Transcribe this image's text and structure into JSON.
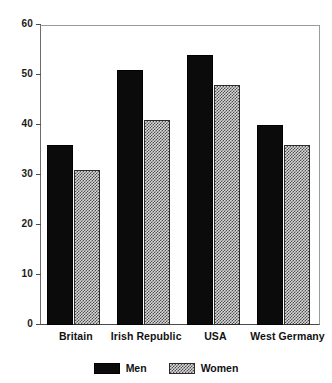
{
  "chart_data": {
    "type": "bar",
    "title": "",
    "subtitle": "",
    "xlabel": "",
    "ylabel": "",
    "categories": [
      "Britain",
      "Irish Republic",
      "USA",
      "West Germany"
    ],
    "series": [
      {
        "name": "Men",
        "values": [
          36,
          51,
          54,
          40
        ],
        "color": "#0b0b0b",
        "fill": "solid-black"
      },
      {
        "name": "Women",
        "values": [
          31,
          41,
          48,
          36
        ],
        "color": "#d8d8d8",
        "fill": "checkered-hatch"
      }
    ],
    "ylim": [
      0,
      60
    ],
    "ytick_step": 10,
    "yticks": [
      0,
      10,
      20,
      30,
      40,
      50,
      60
    ],
    "ytick_labels": [
      "0",
      "10",
      "20",
      "30",
      "40",
      "50",
      "60"
    ],
    "grid": false,
    "legend_position": "bottom-center",
    "frame": true
  },
  "legend": {
    "entries": [
      {
        "label": "Men",
        "swatch": "solid-black-swatch"
      },
      {
        "label": "Women",
        "swatch": "hatched-swatch"
      }
    ]
  },
  "colors": {
    "men_bar": "#0b0b0b",
    "women_bar_base": "#d8d8d8",
    "women_bar_hatch": "#4d4d4d",
    "axis": "#4a4a4a",
    "frame": "#9a9a9a",
    "text": "#111111",
    "background": "#ffffff"
  }
}
